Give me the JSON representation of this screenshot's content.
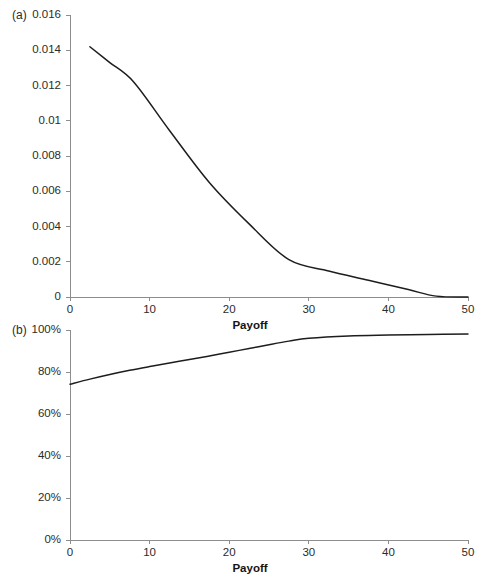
{
  "figure": {
    "panels": [
      {
        "key": "a",
        "label": "(a)"
      },
      {
        "key": "b",
        "label": "(b)"
      }
    ]
  },
  "chart_data": [
    {
      "type": "line",
      "panel": "(a)",
      "title": "",
      "xlabel": "Payoff",
      "ylabel": "",
      "xlim": [
        0,
        50
      ],
      "ylim": [
        0,
        0.016
      ],
      "grid": false,
      "legend": "none",
      "x_ticks": [
        "0",
        "10",
        "20",
        "30",
        "40",
        "50"
      ],
      "x_tick_values": [
        0,
        10,
        20,
        30,
        40,
        50
      ],
      "y_ticks": [
        "0",
        "0.002",
        "0.004",
        "0.006",
        "0.008",
        "0.01",
        "0.012",
        "0.014",
        "0.016"
      ],
      "y_tick_values": [
        0,
        0.002,
        0.004,
        0.006,
        0.008,
        0.01,
        0.012,
        0.014,
        0.016
      ],
      "series": [
        {
          "name": "density",
          "x": [
            2.5,
            5.0,
            8.0,
            12.5,
            17.5,
            22.5,
            27.5,
            32.5,
            37.5,
            42.5,
            46.0,
            50.0
          ],
          "values": [
            0.0142,
            0.0133,
            0.0122,
            0.00945,
            0.0065,
            0.00415,
            0.00212,
            0.00148,
            0.00095,
            0.00042,
            5e-05,
            0.0
          ]
        }
      ]
    },
    {
      "type": "line",
      "panel": "(b)",
      "title": "",
      "xlabel": "Payoff",
      "ylabel": "",
      "xlim": [
        0,
        50
      ],
      "ylim": [
        0,
        100
      ],
      "grid": false,
      "legend": "none",
      "x_ticks": [
        "0",
        "10",
        "20",
        "30",
        "40",
        "50"
      ],
      "x_tick_values": [
        0,
        10,
        20,
        30,
        40,
        50
      ],
      "y_ticks": [
        "0%",
        "20%",
        "40%",
        "60%",
        "80%",
        "100%"
      ],
      "y_tick_values": [
        0,
        20,
        40,
        60,
        80,
        100
      ],
      "series": [
        {
          "name": "cumulative",
          "x": [
            0,
            2.5,
            5,
            7.5,
            10,
            12.5,
            15,
            17.5,
            20,
            22.5,
            25,
            27.5,
            30,
            35,
            40,
            45,
            50
          ],
          "values": [
            74.2,
            76.6,
            78.8,
            80.8,
            82.6,
            84.3,
            85.9,
            87.6,
            89.4,
            91.2,
            93.0,
            94.7,
            96.1,
            97.2,
            97.6,
            97.9,
            98.1
          ]
        }
      ]
    }
  ],
  "colors": {
    "line": "#1d1d1d",
    "axis": "#8d8d8d",
    "text": "#2b2b2b",
    "background": "#ffffff"
  }
}
